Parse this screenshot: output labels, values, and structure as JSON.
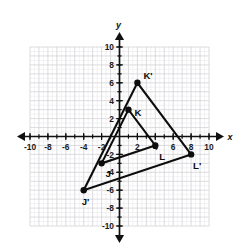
{
  "chart_data": {
    "type": "scatter",
    "title": "",
    "xlabel": "x",
    "ylabel": "y",
    "xlim": [
      -10.5,
      10.5
    ],
    "ylim": [
      -10.5,
      10.5
    ],
    "grid": true,
    "grid_minor_step": 0.5,
    "grid_major_step": 1,
    "legend": "none",
    "x_ticks": [
      -10,
      -8,
      -6,
      -4,
      -2,
      2,
      4,
      6,
      8,
      10
    ],
    "y_ticks": [
      10,
      8,
      6,
      4,
      2,
      -2,
      -4,
      -6,
      -8,
      -10
    ],
    "x_tick_labels": [
      "-10",
      "-8",
      "-6",
      "-4",
      "-2",
      "2",
      "4",
      "6",
      "8",
      "10"
    ],
    "y_tick_labels": [
      "10",
      "8",
      "6",
      "4",
      "2",
      "-2",
      "-4",
      "-6",
      "-8",
      "-10"
    ],
    "series": [
      {
        "name": "Triangle JKL",
        "closed": true,
        "points": [
          {
            "label": "J",
            "x": -2,
            "y": -3,
            "label_dx": 4,
            "label_dy": 14
          },
          {
            "label": "K",
            "x": 1,
            "y": 3,
            "label_dx": 6,
            "label_dy": 6
          },
          {
            "label": "L",
            "x": 4,
            "y": -1,
            "label_dx": 4,
            "label_dy": 15
          }
        ]
      },
      {
        "name": "Triangle J'K'L'",
        "closed": true,
        "points": [
          {
            "label": "J'",
            "x": -4,
            "y": -6,
            "label_dx": -2,
            "label_dy": 15
          },
          {
            "label": "K'",
            "x": 2,
            "y": 6,
            "label_dx": 6,
            "label_dy": -4
          },
          {
            "label": "L'",
            "x": 8,
            "y": -2,
            "label_dx": 2,
            "label_dy": 15
          }
        ]
      }
    ],
    "colors": {
      "shape_stroke": "#0d0d0d",
      "axis": "#111111",
      "major_grid": "#d3d3d8",
      "minor_grid": "#e9e9ec",
      "background": "#ffffff"
    }
  },
  "axes": {
    "x_axis_label": "x",
    "y_axis_label": "y"
  }
}
